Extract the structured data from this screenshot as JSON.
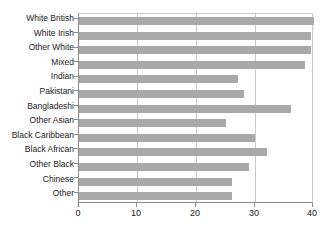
{
  "chart_data": {
    "type": "bar",
    "orientation": "horizontal",
    "title": "",
    "subtitle": "",
    "xlabel": "",
    "ylabel": "",
    "xlim": [
      0,
      40
    ],
    "ylim": null,
    "grid": true,
    "legend": null,
    "legend_position": "none",
    "xticks": [
      0,
      10,
      20,
      30,
      40
    ],
    "xtick_labels": [
      "0",
      "10",
      "20",
      "30",
      "40"
    ],
    "bar_color": "#a8a8a8",
    "axis_color": "#8c8c8c",
    "gridline_color": "#c9c9c9",
    "categories": [
      "White British",
      "White Irish",
      "Other White",
      "Mixed",
      "Indian",
      "Pakistani",
      "Bangladeshi",
      "Other Asian",
      "Black Caribbean",
      "Black African",
      "Other Black",
      "Chinese",
      "Other"
    ],
    "values": [
      40,
      39.5,
      39.5,
      38.5,
      27,
      28,
      36,
      25,
      30,
      32,
      29,
      26,
      26
    ],
    "series": [
      {
        "name": "",
        "values": [
          40,
          39.5,
          39.5,
          38.5,
          27,
          28,
          36,
          25,
          30,
          32,
          29,
          26,
          26
        ]
      }
    ]
  }
}
